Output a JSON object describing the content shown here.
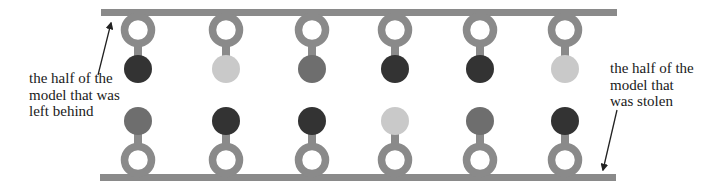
{
  "diagram": {
    "colors": {
      "backbone": "#8a8a8a",
      "dark": "#333333",
      "medium": "#6e6e6e",
      "light": "#c9c9c9",
      "arrow": "#222222",
      "background": "#ffffff"
    },
    "top_strand": {
      "label": "the half of the model that was left behind",
      "label_lines": [
        "the half of the",
        "model that was",
        "left behind"
      ],
      "beads": [
        "dark",
        "light",
        "medium",
        "dark",
        "dark",
        "light"
      ]
    },
    "bottom_strand": {
      "label": "the half of the model that was stolen",
      "label_lines": [
        "the half of the",
        "model that",
        "was stolen"
      ],
      "beads": [
        "medium",
        "dark",
        "dark",
        "light",
        "medium",
        "dark"
      ]
    },
    "column_count": 6
  }
}
